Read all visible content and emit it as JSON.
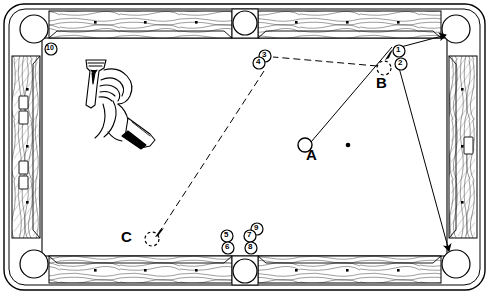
{
  "diagram": {
    "table": {
      "frame_color": "#ffffff",
      "rail_color": "#ffffff",
      "line_color": "#000000",
      "cloth_color": "#ffffff",
      "outer": {
        "x": 4,
        "y": 4,
        "w": 481,
        "h": 286,
        "radius": 18
      },
      "cloth": {
        "x": 42,
        "y": 38,
        "w": 405,
        "h": 218
      }
    },
    "pockets": [
      {
        "name": "pocket-top-left",
        "cx": 34,
        "cy": 29,
        "r": 14
      },
      {
        "name": "pocket-top-middle",
        "cx": 245,
        "cy": 22,
        "r": 12
      },
      {
        "name": "pocket-top-right",
        "cx": 456,
        "cy": 29,
        "r": 14
      },
      {
        "name": "pocket-bottom-left",
        "cx": 34,
        "cy": 264,
        "r": 14
      },
      {
        "name": "pocket-bottom-middle",
        "cx": 245,
        "cy": 272,
        "r": 12
      },
      {
        "name": "pocket-bottom-right",
        "cx": 456,
        "cy": 264,
        "r": 14
      }
    ],
    "diamonds_top": [
      {
        "x": 95,
        "y": 22
      },
      {
        "x": 145,
        "y": 22
      },
      {
        "x": 196,
        "y": 22
      },
      {
        "x": 296,
        "y": 22
      },
      {
        "x": 347,
        "y": 22
      },
      {
        "x": 398,
        "y": 22
      }
    ],
    "diamonds_bottom": [
      {
        "x": 95,
        "y": 267
      },
      {
        "x": 145,
        "y": 267
      },
      {
        "x": 196,
        "y": 267
      },
      {
        "x": 296,
        "y": 267
      },
      {
        "x": 347,
        "y": 267
      },
      {
        "x": 398,
        "y": 267
      }
    ],
    "diamonds_left": [
      {
        "x": 28,
        "y": 90
      },
      {
        "x": 28,
        "y": 147
      },
      {
        "x": 28,
        "y": 203
      }
    ],
    "diamonds_right": [
      {
        "x": 462,
        "y": 90
      },
      {
        "x": 462,
        "y": 147
      },
      {
        "x": 462,
        "y": 203
      }
    ],
    "rail_markers_left": [
      {
        "x": 18,
        "y": 95,
        "w": 9,
        "h": 13
      },
      {
        "x": 18,
        "y": 110,
        "w": 9,
        "h": 13
      },
      {
        "x": 18,
        "y": 160,
        "w": 9,
        "h": 13
      },
      {
        "x": 18,
        "y": 175,
        "w": 9,
        "h": 13
      }
    ],
    "rail_markers_right": [
      {
        "x": 464,
        "y": 137,
        "w": 9,
        "h": 16
      }
    ],
    "table_spot": {
      "x": 348,
      "y": 145,
      "r": 2.2
    },
    "balls": [
      {
        "name": "cue-ball-a",
        "label": "A",
        "x": 305,
        "y": 145,
        "r": 7,
        "style": "solid-outline"
      },
      {
        "name": "ghost-ball-b",
        "label": "B",
        "x": 385,
        "y": 68,
        "r": 7,
        "style": "dashed-outline"
      },
      {
        "name": "ghost-ball-c",
        "label": "C",
        "x": 152,
        "y": 239,
        "r": 7,
        "style": "dashed-outline"
      }
    ],
    "point_labels": [
      {
        "name": "point-label-a",
        "text": "A",
        "x": 308,
        "y": 150
      },
      {
        "name": "point-label-b",
        "text": "B",
        "x": 377,
        "y": 78
      },
      {
        "name": "point-label-c",
        "text": "C",
        "x": 123,
        "y": 229
      }
    ],
    "numbered_markers": [
      {
        "name": "marker-1",
        "text": "1",
        "cx": 399,
        "cy": 51,
        "r": 6
      },
      {
        "name": "marker-2",
        "text": "2",
        "cx": 401,
        "cy": 63,
        "r": 6
      },
      {
        "name": "marker-3",
        "text": "3",
        "cx": 265,
        "cy": 56,
        "r": 6
      },
      {
        "name": "marker-4",
        "text": "4",
        "cx": 259,
        "cy": 63,
        "r": 6
      },
      {
        "name": "marker-5",
        "text": "5",
        "cx": 227,
        "cy": 236,
        "r": 6
      },
      {
        "name": "marker-6",
        "text": "6",
        "cx": 228,
        "cy": 248,
        "r": 6
      },
      {
        "name": "marker-7",
        "text": "7",
        "cx": 251,
        "cy": 236,
        "r": 6
      },
      {
        "name": "marker-8",
        "text": "8",
        "cx": 252,
        "cy": 248,
        "r": 6
      },
      {
        "name": "marker-9",
        "text": "9",
        "cx": 257,
        "cy": 229,
        "r": 6
      },
      {
        "name": "marker-10",
        "text": "10",
        "cx": 51,
        "cy": 49,
        "r": 6
      }
    ],
    "shot_lines": [
      {
        "name": "shot-line-a-to-pocket",
        "style": "solid",
        "points": "305,145 392,47 446,36"
      },
      {
        "name": "shot-line-b-to-bottom-right-pocket",
        "style": "solid",
        "points": "396,62 448,252"
      },
      {
        "name": "shot-line-cue-to-top-right",
        "style": "solid",
        "points": "396,48 447,35"
      },
      {
        "name": "ghost-line-b-to-three",
        "style": "dashed",
        "points": "378,67 272,57"
      },
      {
        "name": "ghost-line-four-to-c",
        "style": "dashed",
        "points": "264,70 159,232"
      }
    ],
    "arrows": [
      {
        "name": "arrow-into-top-right-pocket",
        "x": 447,
        "y": 35,
        "angle": -15
      },
      {
        "name": "arrow-into-bottom-right-pocket",
        "x": 448,
        "y": 252,
        "angle": 75
      },
      {
        "name": "arrow-at-ball-b",
        "x": 390,
        "y": 54,
        "angle": -125
      },
      {
        "name": "arrow-at-ball-c",
        "x": 158,
        "y": 233,
        "angle": 122
      }
    ],
    "illustration": {
      "name": "hand-holding-cue-drawing",
      "caption": "hand bridge with cue line drawing",
      "x": 75,
      "y": 55,
      "w": 85,
      "h": 100
    }
  }
}
